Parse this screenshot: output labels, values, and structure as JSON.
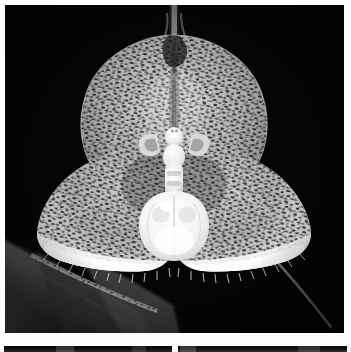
{
  "plate": {
    "kind": "photographic-plate",
    "background_color": "#ffffff",
    "width": 351,
    "height": 352,
    "photo_count_visible": 3
  },
  "main_photo": {
    "name": "orchid-photograph",
    "subject": "Dracula orchid flower (monkey-face orchid)",
    "rendering": "black-and-white macro photograph",
    "background_color": "#050505",
    "frame": {
      "x": 5,
      "y": 5,
      "width": 339,
      "height": 328
    },
    "alt_text": "Close-up black and white photograph of a Dracula orchid flower with a broad heart-shaped dorsal sepal densely covered in dark dash-like speckles, two spreading lateral sepals with white fringed margins, and a pale white column and lip at the centre resembling a small face, set against a black background with a dark leaf entering from the lower left.",
    "parts": [
      {
        "name": "dorsal-sepal",
        "description": "broad heart-shaped upper sepal, pale grey, densely dark-speckled",
        "tone": "#b9b9b9"
      },
      {
        "name": "dorsal-sepal-tail",
        "description": "thin vertical caudate tail rising from the apex of the dorsal sepal",
        "tone": "#8a8a8a"
      },
      {
        "name": "left-lateral-sepal",
        "description": "spreading lower-left sepal with white ciliate fringed margin",
        "tone": "#c9c9c9"
      },
      {
        "name": "right-lateral-sepal",
        "description": "spreading lower-right sepal with white ciliate fringed margin",
        "tone": "#cccccc"
      },
      {
        "name": "lateral-sepal-tail",
        "description": "thin diagonal tail extending to the lower right corner",
        "tone": "#6f6f6f"
      },
      {
        "name": "petals",
        "description": "small paired petals flanking the column like ears",
        "tone": "#e8e8e8"
      },
      {
        "name": "column",
        "description": "narrow pale column below the petals",
        "tone": "#f2f2f2"
      },
      {
        "name": "labellum",
        "description": "swollen white shell-shaped lip at the centre of the bloom",
        "tone": "#fafafa"
      },
      {
        "name": "leaf",
        "description": "dark grey strap-shaped leaf entering from the lower left",
        "tone": "#4a4a4a"
      },
      {
        "name": "pedicel",
        "description": "speckled flower stalk crossing the leaf diagonally",
        "tone": "#9a9a9a"
      }
    ],
    "palette": {
      "background": "#050505",
      "highlight": "#ffffff",
      "midtone": "#b9b9b9",
      "shadow": "#2a2a2a",
      "speckle": "#1a1a1a"
    }
  },
  "bottom_photos": [
    {
      "name": "lower-left-photo",
      "description": "top edge of the next photograph in the plate, dark toned",
      "frame": {
        "x": 4,
        "y": 346,
        "width": 168,
        "height": 6
      }
    },
    {
      "name": "lower-right-photo",
      "description": "top edge of the adjacent photograph in the plate, dark toned",
      "frame": {
        "x": 178,
        "y": 346,
        "width": 169,
        "height": 6
      }
    }
  ]
}
